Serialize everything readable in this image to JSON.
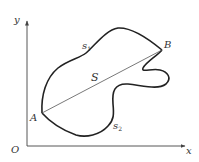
{
  "diagram": {
    "axes": {
      "x_label": "x",
      "y_label": "y",
      "origin_label": "O"
    },
    "points": {
      "A": "A",
      "B": "B"
    },
    "curves": {
      "upper_arc_label": "s",
      "upper_arc_sub": "1",
      "lower_arc_label": "s",
      "lower_arc_sub": "2",
      "chord_label": "S"
    },
    "colors": {
      "stroke": "#222222",
      "axis": "#444444",
      "chord": "#555555",
      "background": "#ffffff"
    }
  }
}
